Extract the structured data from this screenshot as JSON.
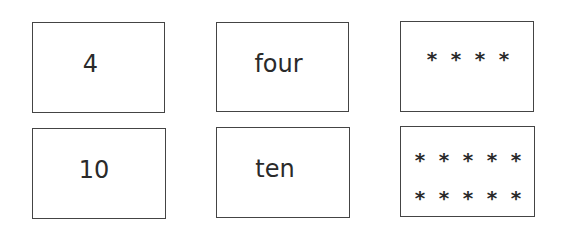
{
  "cards": [
    {
      "id": "numeral-4",
      "text": "4"
    },
    {
      "id": "word-four",
      "text": "four"
    },
    {
      "id": "dots-four",
      "symbol": "*",
      "rows": [
        4
      ]
    },
    {
      "id": "numeral-10",
      "text": "10"
    },
    {
      "id": "word-ten",
      "text": "ten"
    },
    {
      "id": "dots-ten",
      "symbol": "*",
      "rows": [
        5,
        5
      ]
    }
  ],
  "star_symbol": "*"
}
